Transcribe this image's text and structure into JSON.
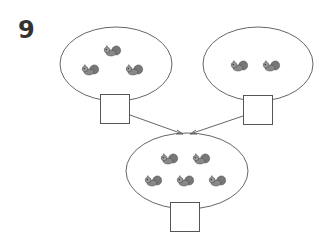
{
  "problem": {
    "number": "9",
    "groups": [
      {
        "id": "left",
        "squirrel_count": 3,
        "answer_box": ""
      },
      {
        "id": "right",
        "squirrel_count": 2,
        "answer_box": ""
      },
      {
        "id": "total",
        "squirrel_count": 5,
        "answer_box": ""
      }
    ],
    "icon": "squirrel-icon",
    "colors": {
      "stroke": "#666666",
      "squirrel": "#6e6e6e"
    }
  }
}
